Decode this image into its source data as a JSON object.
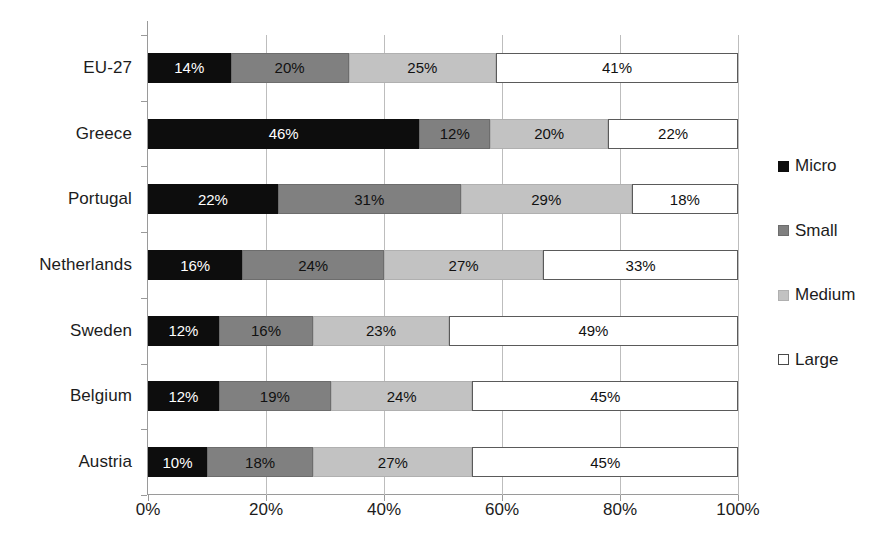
{
  "chart_data": {
    "type": "bar",
    "subtype": "horizontal-stacked-100",
    "title": "",
    "xlabel": "",
    "ylabel": "",
    "categories": [
      "EU-27",
      "Greece",
      "Portugal",
      "Netherlands",
      "Sweden",
      "Belgium",
      "Austria"
    ],
    "series": [
      {
        "name": "Micro",
        "color": "#0d0d0d",
        "values": [
          14,
          46,
          22,
          16,
          12,
          12,
          10
        ]
      },
      {
        "name": "Small",
        "color": "#808080",
        "values": [
          20,
          12,
          31,
          24,
          16,
          19,
          18
        ]
      },
      {
        "name": "Medium",
        "color": "#c2c2c2",
        "values": [
          25,
          20,
          29,
          27,
          23,
          24,
          27
        ]
      },
      {
        "name": "Large",
        "color": "#ffffff",
        "values": [
          41,
          22,
          18,
          33,
          49,
          45,
          45
        ]
      }
    ],
    "data_labels": [
      [
        "14%",
        "20%",
        "25%",
        "41%"
      ],
      [
        "46%",
        "12%",
        "20%",
        "22%"
      ],
      [
        "22%",
        "31%",
        "29%",
        "18%"
      ],
      [
        "16%",
        "24%",
        "27%",
        "33%"
      ],
      [
        "12%",
        "16%",
        "23%",
        "49%"
      ],
      [
        "12%",
        "19%",
        "24%",
        "45%"
      ],
      [
        "10%",
        "18%",
        "27%",
        "45%"
      ]
    ],
    "xlim": [
      0,
      100
    ],
    "xticks": [
      0,
      20,
      40,
      60,
      80,
      100
    ],
    "xtick_labels": [
      "0%",
      "20%",
      "40%",
      "60%",
      "80%",
      "100%"
    ],
    "grid": "vertical",
    "legend_position": "right",
    "legend_entries": [
      "Micro",
      "Small",
      "Medium",
      "Large"
    ]
  }
}
